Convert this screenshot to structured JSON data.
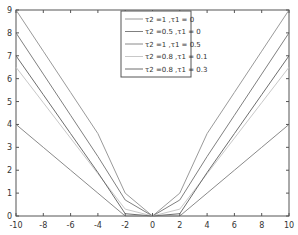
{
  "chart_data": {
    "type": "line",
    "title": "",
    "xlabel": "",
    "ylabel": "",
    "xlim": [
      -10,
      10
    ],
    "ylim": [
      0,
      9
    ],
    "grid": false,
    "legend_position": "upper center",
    "x": [
      -10,
      -8,
      -6,
      -4,
      -2,
      0,
      2,
      4,
      6,
      8,
      10
    ],
    "xticks": [
      "-10",
      "-8",
      "-6",
      "-4",
      "-2",
      "0",
      "2",
      "4",
      "6",
      "8",
      "10"
    ],
    "yticks": [
      "0",
      "1",
      "2",
      "3",
      "4",
      "5",
      "6",
      "7",
      "8",
      "9"
    ],
    "series": [
      {
        "name": "τ2 =1 ,τ1 = 0",
        "color": "#9a9a9a",
        "values": [
          9,
          7.2,
          5.4,
          3.6,
          1.0,
          0,
          1.0,
          3.6,
          5.4,
          7.2,
          9
        ]
      },
      {
        "name": "τ2 =0.5 ,τ1 = 0",
        "color": "#808080",
        "values": [
          8,
          6.2,
          4.4,
          2.6,
          0.7,
          0,
          0.7,
          2.6,
          4.4,
          6.2,
          8
        ]
      },
      {
        "name": "τ2 =1 ,τ1 = 0.5",
        "color": "#8a8a8a",
        "values": [
          4,
          3,
          2,
          1,
          0,
          0,
          0,
          1,
          2,
          3,
          4
        ]
      },
      {
        "name": "τ2 =0.8 ,τ1 = 0.1",
        "color": "#c8c8c8",
        "values": [
          6.5,
          4.95,
          3.4,
          1.85,
          0.3,
          0,
          0.3,
          1.85,
          3.4,
          4.95,
          6.5
        ]
      },
      {
        "name": "τ2 =0.8 ,τ1 = 0.3",
        "color": "#6e6e6e",
        "values": [
          7,
          5.3,
          3.6,
          1.9,
          0.1,
          0,
          0.1,
          1.9,
          3.6,
          5.3,
          7
        ]
      }
    ]
  }
}
